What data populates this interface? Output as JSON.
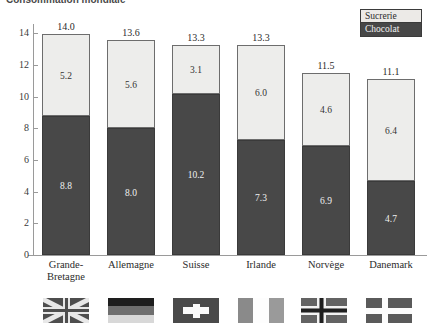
{
  "title": "Consommation mondiale",
  "legend": {
    "position": "top-right",
    "entries": [
      {
        "label": "Sucrerie",
        "color": "#ededeb",
        "name": "legend-sucrerie"
      },
      {
        "label": "Chocolat",
        "color": "#484848",
        "name": "legend-chocolat"
      }
    ]
  },
  "axis": {
    "yticks": [
      "14",
      "12",
      "10",
      "8",
      "6",
      "4",
      "2",
      "0"
    ],
    "ylim_min": 0,
    "ylim_max": 14.6
  },
  "flags": [
    {
      "country": "Grande-Bretagne",
      "name": "flag-united-kingdom"
    },
    {
      "country": "Allemagne",
      "name": "flag-germany"
    },
    {
      "country": "Suisse",
      "name": "flag-switzerland"
    },
    {
      "country": "Irlande",
      "name": "flag-ireland"
    },
    {
      "country": "Norvège",
      "name": "flag-norway"
    },
    {
      "country": "Danemark",
      "name": "flag-denmark"
    }
  ],
  "chart_data": {
    "type": "bar",
    "subtype": "stacked",
    "title": "Consommation mondiale",
    "xlabel": "",
    "ylabel": "",
    "ylim": [
      0,
      14.6
    ],
    "grid": false,
    "legend_position": "top-right",
    "categories": [
      "Grande-Bretagne",
      "Allemagne",
      "Suisse",
      "Irlande",
      "Norvège",
      "Danemark"
    ],
    "category_lines": [
      [
        "Grande-",
        "Bretagne"
      ],
      [
        "Allemagne"
      ],
      [
        "Suisse"
      ],
      [
        "Irlande"
      ],
      [
        "Norvège"
      ],
      [
        "Danemark"
      ]
    ],
    "series": [
      {
        "name": "Chocolat",
        "color": "#484848",
        "values": [
          8.8,
          8.0,
          10.2,
          7.3,
          6.9,
          4.7
        ]
      },
      {
        "name": "Sucrerie",
        "color": "#ededeb",
        "values": [
          5.2,
          5.6,
          3.1,
          6.0,
          4.6,
          6.4
        ]
      }
    ],
    "totals": [
      14.0,
      13.6,
      13.3,
      13.3,
      11.5,
      11.1
    ],
    "value_labels": {
      "chocolat": [
        "8.8",
        "8.0",
        "10.2",
        "7.3",
        "6.9",
        "4.7"
      ],
      "sucrerie": [
        "5.2",
        "5.6",
        "3.1",
        "6.0",
        "4.6",
        "6.4"
      ],
      "totals": [
        "14.0",
        "13.6",
        "13.3",
        "13.3",
        "11.5",
        "11.1"
      ]
    }
  }
}
